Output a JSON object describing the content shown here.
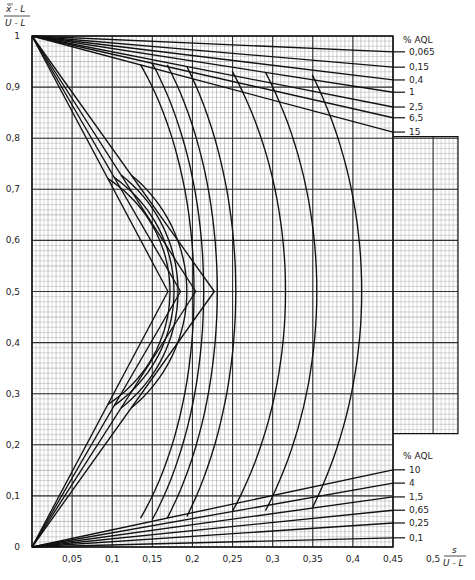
{
  "chart_data": {
    "type": "line",
    "title": "",
    "xlabel": "s / (U-L)",
    "ylabel": "(x̄-L) / (U-L)",
    "xlim": [
      0,
      0.45
    ],
    "ylim": [
      0,
      1
    ],
    "grid": true,
    "x_ticks": [
      {
        "value": 0.05,
        "label": "0,05"
      },
      {
        "value": 0.1,
        "label": "0,1"
      },
      {
        "value": 0.15,
        "label": "0,15"
      },
      {
        "value": 0.2,
        "label": "0,2"
      },
      {
        "value": 0.25,
        "label": "0,25"
      },
      {
        "value": 0.3,
        "label": "0,3"
      },
      {
        "value": 0.35,
        "label": "0,35"
      },
      {
        "value": 0.4,
        "label": "0,4"
      },
      {
        "value": 0.45,
        "label": "0,45"
      },
      {
        "value": 0.5,
        "label": "0,5"
      }
    ],
    "y_ticks": [
      {
        "value": 0,
        "label": "0"
      },
      {
        "value": 0.1,
        "label": "0,1"
      },
      {
        "value": 0.2,
        "label": "0,2"
      },
      {
        "value": 0.3,
        "label": "0,3"
      },
      {
        "value": 0.4,
        "label": "0,4"
      },
      {
        "value": 0.5,
        "label": "0,5"
      },
      {
        "value": 0.6,
        "label": "0,6"
      },
      {
        "value": 0.7,
        "label": "0,7"
      },
      {
        "value": 0.8,
        "label": "0,8"
      },
      {
        "value": 0.9,
        "label": "0,9"
      },
      {
        "value": 1,
        "label": "1"
      }
    ],
    "upper_legend": {
      "title": "% AQL",
      "entries": [
        {
          "label": "0,065",
          "end_y": 0.969
        },
        {
          "label": "0,15",
          "end_y": 0.939
        },
        {
          "label": "0,4",
          "end_y": 0.914
        },
        {
          "label": "1",
          "end_y": 0.89
        },
        {
          "label": "2,5",
          "end_y": 0.861
        },
        {
          "label": "6,5",
          "end_y": 0.84
        },
        {
          "label": "15",
          "end_y": 0.812
        }
      ]
    },
    "lower_legend": {
      "title": "% AQL",
      "entries": [
        {
          "label": "10",
          "end_y": 0.151
        },
        {
          "label": "4",
          "end_y": 0.125
        },
        {
          "label": "1,5",
          "end_y": 0.098
        },
        {
          "label": "0,65",
          "end_y": 0.072
        },
        {
          "label": "0,25",
          "end_y": 0.047
        },
        {
          "label": "0,1",
          "end_y": 0.018
        }
      ]
    },
    "arc_peaks_x_at_y_0_5": [
      0.172,
      0.177,
      0.182,
      0.193,
      0.202,
      0.214,
      0.231,
      0.254,
      0.316,
      0.355,
      0.411
    ]
  }
}
